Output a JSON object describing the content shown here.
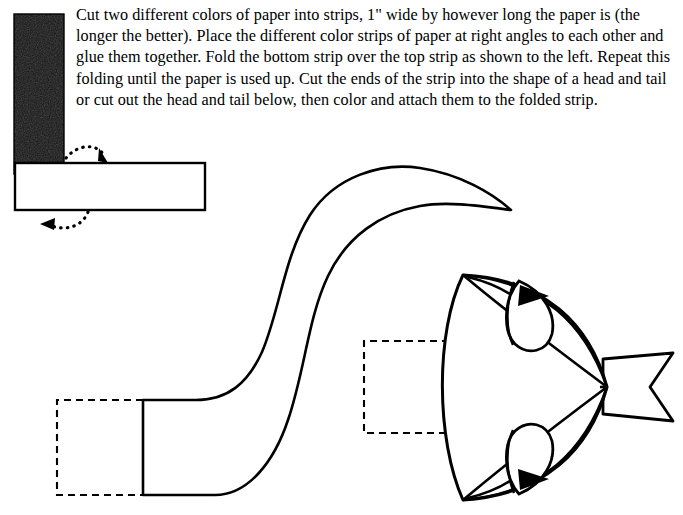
{
  "page": {
    "width": 683,
    "height": 515,
    "background_color": "#ffffff",
    "ink_color": "#000000"
  },
  "instructions": {
    "body_text": "Cut two different colors of paper into strips, 1\" wide by however long the paper is (the longer the better). Place the different color strips of paper at right angles to each other and glue them together. Fold the bottom strip over the top strip as shown to the left. Repeat this folding until the paper is used up. Cut the ends of the strip into the shape of a head and tail or cut out the head and tail below, then color and attach them to the folded strip."
  },
  "fold_diagram": {
    "dark_strip": {
      "label": "vertical-dark-paper-strip",
      "fill": "#141414",
      "x": 14,
      "y": 14,
      "width": 50,
      "height": 160
    },
    "light_strip": {
      "label": "horizontal-light-paper-strip",
      "fill": "#ffffff",
      "stroke": "#000000",
      "x": 15,
      "y": 163,
      "width": 190,
      "height": 47
    },
    "arrows": [
      {
        "label": "fold-arrow-upper",
        "style": "dotted-curved-arrow"
      },
      {
        "label": "fold-arrow-lower",
        "style": "dotted-curved-arrow"
      }
    ]
  },
  "cutouts": {
    "tail": {
      "label": "fish-tail-cutout",
      "stroke": "#000000",
      "fill": "#ffffff",
      "glue_tab": {
        "label": "tail-glue-tab-dashed",
        "style": "dashed"
      }
    },
    "head": {
      "label": "fish-head-cutout",
      "stroke": "#000000",
      "fill": "#ffffff",
      "eyes": 2,
      "pupil_fill": "#000000",
      "snout_tab": {
        "label": "head-notched-tab",
        "style": "solid"
      },
      "glue_tab": {
        "label": "head-glue-tab-dashed",
        "style": "dashed"
      }
    }
  }
}
